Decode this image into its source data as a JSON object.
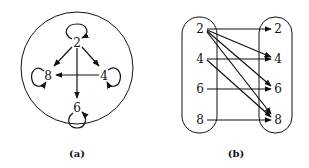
{
  "figure": {
    "panel_a": {
      "caption": "(a)",
      "nodes": [
        {
          "id": "2",
          "label": "2",
          "x": 77,
          "y": 43
        },
        {
          "id": "8",
          "label": "8",
          "x": 48,
          "y": 76
        },
        {
          "id": "4",
          "label": "4",
          "x": 104,
          "y": 76
        },
        {
          "id": "6",
          "label": "6",
          "x": 77,
          "y": 108
        }
      ],
      "edges": [
        {
          "from": "2",
          "to": "8"
        },
        {
          "from": "2",
          "to": "4"
        },
        {
          "from": "2",
          "to": "6"
        },
        {
          "from": "4",
          "to": "8"
        }
      ],
      "self_loops": [
        "2",
        "8",
        "4",
        "6"
      ]
    },
    "panel_b": {
      "caption": "(b)",
      "left_nodes": [
        "2",
        "4",
        "6",
        "8"
      ],
      "right_nodes": [
        "2",
        "4",
        "6",
        "8"
      ],
      "edges": [
        {
          "from": "2",
          "to": "2"
        },
        {
          "from": "2",
          "to": "4"
        },
        {
          "from": "2",
          "to": "6"
        },
        {
          "from": "2",
          "to": "8"
        },
        {
          "from": "4",
          "to": "4"
        },
        {
          "from": "4",
          "to": "8"
        },
        {
          "from": "6",
          "to": "6"
        },
        {
          "from": "8",
          "to": "8"
        }
      ]
    }
  }
}
